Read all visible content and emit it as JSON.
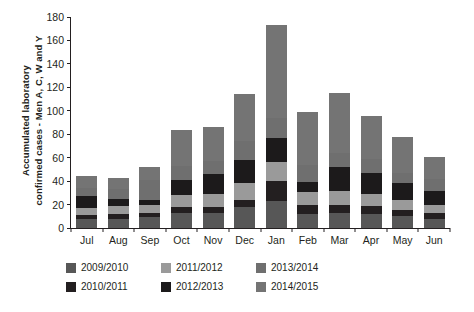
{
  "chart_data": {
    "type": "bar",
    "stacked": true,
    "title": "",
    "xlabel": "",
    "ylabel": "Accumulated laboratory confirmed cases - Men A, C, W and Y",
    "ylabel_line1": "Accumulated laboratory",
    "ylabel_line2": "confirmed cases - Men A, C, W and Y",
    "ylim": [
      0,
      180
    ],
    "yticks": [
      0,
      20,
      40,
      60,
      80,
      100,
      120,
      140,
      160,
      180
    ],
    "grid": false,
    "legend_position": "bottom",
    "categories": [
      "Jul",
      "Aug",
      "Sep",
      "Oct",
      "Nov",
      "Dec",
      "Jan",
      "Feb",
      "Mar",
      "Apr",
      "May",
      "Jun"
    ],
    "series": [
      {
        "name": "2009/2010",
        "color": "#575757",
        "values": [
          8,
          8,
          9,
          13,
          13,
          18,
          23,
          12,
          13,
          12,
          10,
          8
        ]
      },
      {
        "name": "2010/2011",
        "color": "#231f20",
        "values": [
          3,
          4,
          4,
          5,
          5,
          6,
          17,
          8,
          7,
          7,
          5,
          5
        ]
      },
      {
        "name": "2011/2012",
        "color": "#9a9a9a",
        "values": [
          6,
          7,
          7,
          10,
          11,
          14,
          16,
          11,
          12,
          10,
          9,
          7
        ]
      },
      {
        "name": "2012/2013",
        "color": "#1c1a1b",
        "values": [
          10,
          6,
          4,
          13,
          17,
          20,
          21,
          8,
          20,
          18,
          14,
          12
        ]
      },
      {
        "name": "2013/2014",
        "color": "#6f6f6f",
        "values": [
          7,
          8,
          17,
          12,
          11,
          16,
          17,
          15,
          12,
          12,
          9,
          10
        ]
      },
      {
        "name": "2014/2015",
        "color": "#747474",
        "values": [
          10,
          10,
          11,
          31,
          29,
          40,
          79,
          45,
          51,
          37,
          31,
          19
        ]
      }
    ],
    "totals": [
      44,
      43,
      52,
      84,
      86,
      114,
      173,
      99,
      115,
      96,
      78,
      61
    ]
  },
  "legend": {
    "items": [
      {
        "label": "2009/2010",
        "color": "#575757"
      },
      {
        "label": "2011/2012",
        "color": "#9a9a9a"
      },
      {
        "label": "2013/2014",
        "color": "#6f6f6f"
      },
      {
        "label": "2010/2011",
        "color": "#231f20"
      },
      {
        "label": "2012/2013",
        "color": "#1c1a1b"
      },
      {
        "label": "2014/2015",
        "color": "#747474"
      }
    ]
  }
}
